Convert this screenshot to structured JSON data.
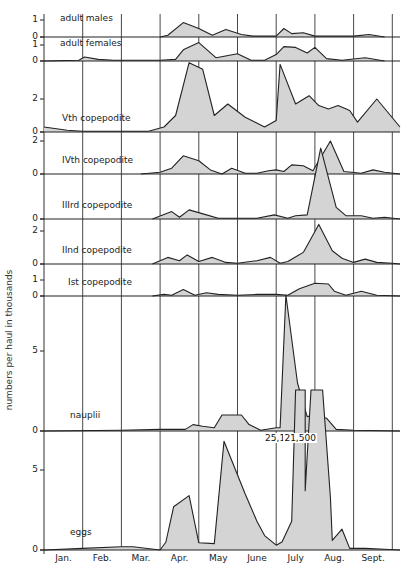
{
  "chart_data": {
    "type": "area",
    "title": "",
    "ylabel": "numbers per haul in thousands",
    "xlabel": "",
    "months": [
      "Jan.",
      "Feb.",
      "Mar.",
      "Apr.",
      "May",
      "June",
      "July",
      "Aug.",
      "Sept."
    ],
    "grid": "vertical month lines",
    "fill_color": "#d4d4d4",
    "line_color": "#222222",
    "annotations": [
      {
        "text": "25,100",
        "panel": "eggs",
        "x_month": 6.1
      },
      {
        "text": "21,500",
        "panel": "eggs",
        "x_month": 6.6
      }
    ],
    "panels": [
      {
        "name": "adult males",
        "y0": 37,
        "scale": 17,
        "ticks": [
          0,
          1
        ],
        "label_x": 60,
        "label_y": 13,
        "points": [
          [
            3.0,
            0
          ],
          [
            3.2,
            0.1
          ],
          [
            3.6,
            0.85
          ],
          [
            4.0,
            0.5
          ],
          [
            4.35,
            0.1
          ],
          [
            4.7,
            0.45
          ],
          [
            5.1,
            0.15
          ],
          [
            5.4,
            0.05
          ],
          [
            6.0,
            0.05
          ],
          [
            6.2,
            0.5
          ],
          [
            6.4,
            0.2
          ],
          [
            6.7,
            0.25
          ],
          [
            7.0,
            0.05
          ],
          [
            8.0,
            0.05
          ],
          [
            8.4,
            0.15
          ],
          [
            8.8,
            0
          ]
        ]
      },
      {
        "name": "adult females",
        "y0": 61,
        "scale": 16,
        "ticks": [
          0,
          1
        ],
        "label_x": 60,
        "label_y": 38,
        "points": [
          [
            0,
            0
          ],
          [
            0.9,
            0.05
          ],
          [
            1.05,
            0.25
          ],
          [
            1.4,
            0.1
          ],
          [
            1.8,
            0.05
          ],
          [
            2.4,
            0.05
          ],
          [
            3.0,
            0.05
          ],
          [
            3.4,
            0.1
          ],
          [
            3.6,
            0.7
          ],
          [
            4.0,
            1.15
          ],
          [
            4.45,
            0.2
          ],
          [
            5.0,
            0.45
          ],
          [
            5.35,
            0.05
          ],
          [
            5.7,
            0.05
          ],
          [
            6.0,
            0.4
          ],
          [
            6.2,
            0.9
          ],
          [
            6.5,
            0.85
          ],
          [
            6.8,
            0.5
          ],
          [
            7.0,
            0.85
          ],
          [
            7.3,
            0.15
          ],
          [
            7.7,
            0.05
          ],
          [
            8.3,
            0.2
          ],
          [
            8.8,
            0
          ]
        ]
      },
      {
        "name": "Vth copepodite",
        "y0": 132,
        "scale": 16.5,
        "ticks": [
          0,
          2
        ],
        "label_x": 62,
        "label_y": 113,
        "points": [
          [
            0,
            0.3
          ],
          [
            0.6,
            0.1
          ],
          [
            1.0,
            0.05
          ],
          [
            2.0,
            0.05
          ],
          [
            2.7,
            0.05
          ],
          [
            3.1,
            0.3
          ],
          [
            3.4,
            1.0
          ],
          [
            3.75,
            4.2
          ],
          [
            4.1,
            3.8
          ],
          [
            4.4,
            1.0
          ],
          [
            4.75,
            1.7
          ],
          [
            5.2,
            0.9
          ],
          [
            5.7,
            0.3
          ],
          [
            6.0,
            0.7
          ],
          [
            6.1,
            4.1
          ],
          [
            6.5,
            1.7
          ],
          [
            6.85,
            2.2
          ],
          [
            7.1,
            1.6
          ],
          [
            7.35,
            1.4
          ],
          [
            7.6,
            1.6
          ],
          [
            7.9,
            1.3
          ],
          [
            8.1,
            0.6
          ],
          [
            8.6,
            2.0
          ],
          [
            9.2,
            0.3
          ]
        ]
      },
      {
        "name": "IVth copepodite",
        "y0": 174,
        "scale": 16.5,
        "ticks": [
          0,
          2
        ],
        "label_x": 62,
        "label_y": 155,
        "points": [
          [
            2.5,
            0
          ],
          [
            3.0,
            0.1
          ],
          [
            3.3,
            0.35
          ],
          [
            3.6,
            1.1
          ],
          [
            4.0,
            0.8
          ],
          [
            4.3,
            0.25
          ],
          [
            4.6,
            0.0
          ],
          [
            4.85,
            0.35
          ],
          [
            5.2,
            0.05
          ],
          [
            5.5,
            0.05
          ],
          [
            5.8,
            0.2
          ],
          [
            6.0,
            0.25
          ],
          [
            6.2,
            0.15
          ],
          [
            6.4,
            0.55
          ],
          [
            6.7,
            0.5
          ],
          [
            6.95,
            0.2
          ],
          [
            7.4,
            2.0
          ],
          [
            7.75,
            0.15
          ],
          [
            8.2,
            0.05
          ],
          [
            8.5,
            0.25
          ],
          [
            8.8,
            0.1
          ],
          [
            9.2,
            0
          ]
        ]
      },
      {
        "name": "IIIrd copepodite",
        "y0": 219,
        "scale": 16.5,
        "ticks": [
          0
        ],
        "label_x": 62,
        "label_y": 200,
        "points": [
          [
            2.8,
            0
          ],
          [
            3.3,
            0.45
          ],
          [
            3.5,
            0.1
          ],
          [
            3.75,
            0.55
          ],
          [
            4.2,
            0.25
          ],
          [
            4.5,
            0.05
          ],
          [
            5.0,
            0.05
          ],
          [
            5.5,
            0.05
          ],
          [
            5.95,
            0.25
          ],
          [
            6.3,
            0.05
          ],
          [
            6.5,
            0.2
          ],
          [
            6.8,
            0.25
          ],
          [
            7.15,
            4.3
          ],
          [
            7.55,
            0.7
          ],
          [
            7.8,
            0.2
          ],
          [
            8.2,
            0.2
          ],
          [
            8.5,
            0.05
          ],
          [
            8.8,
            0.1
          ],
          [
            9.2,
            0
          ]
        ]
      },
      {
        "name": "IInd copepodite",
        "y0": 264,
        "scale": 16.5,
        "ticks": [
          0,
          2
        ],
        "label_x": 62,
        "label_y": 245,
        "points": [
          [
            2.8,
            0
          ],
          [
            3.2,
            0.4
          ],
          [
            3.5,
            0.2
          ],
          [
            3.7,
            0.55
          ],
          [
            4.0,
            0.15
          ],
          [
            4.35,
            0.4
          ],
          [
            4.7,
            0.1
          ],
          [
            5.0,
            0.05
          ],
          [
            5.5,
            0.2
          ],
          [
            5.85,
            0.4
          ],
          [
            6.1,
            0.05
          ],
          [
            6.3,
            0.15
          ],
          [
            6.7,
            0.7
          ],
          [
            7.1,
            2.4
          ],
          [
            7.45,
            0.8
          ],
          [
            7.7,
            0.35
          ],
          [
            8.0,
            0.1
          ],
          [
            8.3,
            0.3
          ],
          [
            8.6,
            0.1
          ],
          [
            9.0,
            0.05
          ],
          [
            9.2,
            0
          ]
        ]
      },
      {
        "name": "Ist copepodite",
        "y0": 296,
        "scale": 16,
        "ticks": [
          0,
          1
        ],
        "label_x": 68,
        "label_y": 277,
        "points": [
          [
            2.8,
            0
          ],
          [
            3.1,
            0.1
          ],
          [
            3.3,
            0.05
          ],
          [
            3.6,
            0.4
          ],
          [
            3.9,
            0.05
          ],
          [
            4.2,
            0.2
          ],
          [
            4.5,
            0.1
          ],
          [
            5.0,
            0.05
          ],
          [
            5.5,
            0.1
          ],
          [
            6.0,
            0.1
          ],
          [
            6.3,
            0.05
          ],
          [
            6.6,
            0.45
          ],
          [
            7.0,
            0.8
          ],
          [
            7.35,
            0.75
          ],
          [
            7.5,
            0.3
          ],
          [
            7.8,
            0.05
          ],
          [
            8.2,
            0.3
          ],
          [
            8.6,
            0.05
          ],
          [
            9.2,
            0
          ]
        ]
      },
      {
        "name": "nauplii",
        "y0": 431,
        "scale": 16,
        "ticks": [
          0,
          5
        ],
        "label_x": 70,
        "label_y": 410,
        "points": [
          [
            0,
            0
          ],
          [
            2.0,
            0.05
          ],
          [
            3.0,
            0.1
          ],
          [
            3.65,
            0.1
          ],
          [
            3.85,
            0.4
          ],
          [
            4.1,
            0.3
          ],
          [
            4.4,
            0.2
          ],
          [
            4.6,
            1.0
          ],
          [
            5.1,
            1.0
          ],
          [
            5.3,
            0.4
          ],
          [
            5.6,
            0.05
          ],
          [
            6.0,
            0.2
          ],
          [
            6.1,
            0.2
          ],
          [
            6.25,
            8.5
          ],
          [
            6.55,
            3.0
          ],
          [
            6.8,
            0.9
          ],
          [
            7.0,
            1.0
          ],
          [
            7.3,
            0.8
          ],
          [
            7.55,
            0.1
          ],
          [
            8.0,
            0.05
          ],
          [
            9.2,
            0
          ]
        ]
      },
      {
        "name": "eggs",
        "y0": 550,
        "scale": 16,
        "ticks": [
          0,
          5
        ],
        "label_x": 70,
        "label_y": 527,
        "points": [
          [
            0,
            0
          ],
          [
            1.0,
            0.1
          ],
          [
            2.0,
            0.2
          ],
          [
            2.3,
            0.2
          ],
          [
            3.0,
            0.0
          ],
          [
            3.15,
            0.5
          ],
          [
            3.35,
            2.7
          ],
          [
            3.75,
            3.4
          ],
          [
            4.0,
            0.45
          ],
          [
            4.4,
            0.4
          ],
          [
            4.65,
            6.8
          ],
          [
            5.2,
            3.5
          ],
          [
            5.5,
            1.8
          ],
          [
            5.7,
            0.9
          ],
          [
            6.0,
            0.3
          ],
          [
            6.15,
            0.5
          ],
          [
            6.4,
            1.8
          ],
          [
            6.5,
            10.0
          ],
          [
            6.75,
            10.0
          ],
          [
            6.75,
            3.7
          ],
          [
            6.9,
            10.0
          ],
          [
            7.2,
            10.0
          ],
          [
            7.4,
            3.3
          ],
          [
            7.45,
            0.6
          ],
          [
            7.7,
            1.3
          ],
          [
            7.9,
            0.1
          ],
          [
            8.3,
            0.1
          ],
          [
            8.8,
            0.05
          ],
          [
            9.2,
            0
          ]
        ]
      }
    ]
  }
}
